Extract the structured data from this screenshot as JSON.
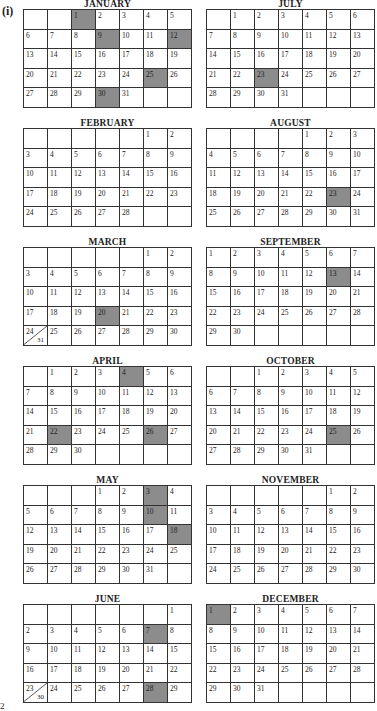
{
  "figure_label": "(i)",
  "corner_mark": "2",
  "months": [
    {
      "name": "JANUARY",
      "col": 0,
      "row": 0,
      "start": 2,
      "days": 31,
      "highlighted": [
        1,
        9,
        12,
        25,
        30
      ]
    },
    {
      "name": "FEBRUARY",
      "col": 0,
      "row": 1,
      "start": 5,
      "days": 28,
      "highlighted": []
    },
    {
      "name": "MARCH",
      "col": 0,
      "row": 2,
      "start": 5,
      "days": 31,
      "highlighted": [
        20
      ],
      "split": {
        "24": 31
      }
    },
    {
      "name": "APRIL",
      "col": 0,
      "row": 3,
      "start": 1,
      "days": 30,
      "highlighted": [
        4,
        22,
        26
      ]
    },
    {
      "name": "MAY",
      "col": 0,
      "row": 4,
      "start": 3,
      "days": 31,
      "highlighted": [
        3,
        10,
        18
      ]
    },
    {
      "name": "JUNE",
      "col": 0,
      "row": 5,
      "start": 6,
      "days": 30,
      "highlighted": [
        7,
        28
      ],
      "split": {
        "23": 30
      }
    },
    {
      "name": "JULY",
      "col": 1,
      "row": 0,
      "start": 1,
      "days": 31,
      "highlighted": [
        23
      ]
    },
    {
      "name": "AUGUST",
      "col": 1,
      "row": 1,
      "start": 4,
      "days": 31,
      "highlighted": [
        23
      ]
    },
    {
      "name": "SEPTEMBER",
      "col": 1,
      "row": 2,
      "start": 0,
      "days": 30,
      "highlighted": [
        13
      ]
    },
    {
      "name": "OCTOBER",
      "col": 1,
      "row": 3,
      "start": 2,
      "days": 31,
      "highlighted": [
        25
      ]
    },
    {
      "name": "NOVEMBER",
      "col": 1,
      "row": 4,
      "start": 5,
      "days": 30,
      "highlighted": []
    },
    {
      "name": "DECEMBER",
      "col": 1,
      "row": 5,
      "start": 0,
      "days": 31,
      "highlighted": [
        1
      ]
    }
  ]
}
